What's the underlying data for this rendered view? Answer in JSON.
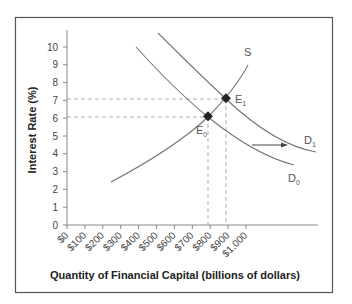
{
  "chart_data": {
    "type": "line",
    "title": "",
    "xlabel": "Quantity of Financial Capital (billions of dollars)",
    "ylabel": "Interest Rate (%)",
    "x_ticks": [
      "$0",
      "$100",
      "$200",
      "$300",
      "$400",
      "$500",
      "$600",
      "$700",
      "$800",
      "$900",
      "$1,000"
    ],
    "y_ticks": [
      "0",
      "1",
      "2",
      "3",
      "4",
      "5",
      "6",
      "7",
      "8",
      "9",
      "10"
    ],
    "xlim": [
      0,
      1000
    ],
    "ylim": [
      0,
      10
    ],
    "grid": false,
    "series": [
      {
        "name": "S",
        "points": [
          [
            250,
            2.4
          ],
          [
            500,
            4.0
          ],
          [
            800,
            6.0
          ],
          [
            900,
            7.0
          ],
          [
            1000,
            9.0
          ]
        ]
      },
      {
        "name": "D0",
        "points": [
          [
            385,
            10.0
          ],
          [
            600,
            8.0
          ],
          [
            800,
            6.0
          ],
          [
            1000,
            4.5
          ],
          [
            1260,
            3.3
          ]
        ]
      },
      {
        "name": "D1",
        "points": [
          [
            505,
            10.8
          ],
          [
            700,
            9.0
          ],
          [
            900,
            7.0
          ],
          [
            1100,
            5.0
          ],
          [
            1380,
            4.0
          ]
        ]
      }
    ],
    "annotations": [
      {
        "label": "E0",
        "x": 800,
        "y": 6
      },
      {
        "label": "E1",
        "x": 900,
        "y": 7
      },
      {
        "label": "arrow",
        "text": "shift right from D0 to D1"
      }
    ]
  },
  "labels": {
    "s": "S",
    "d0": "D",
    "d0_sub": "0",
    "d1": "D",
    "d1_sub": "1",
    "e0": "E",
    "e0_sub": "0",
    "e1": "E",
    "e1_sub": "1",
    "xlabel": "Quantity of Financial Capital (billions of dollars)",
    "ylabel": "Interest Rate (%)"
  }
}
